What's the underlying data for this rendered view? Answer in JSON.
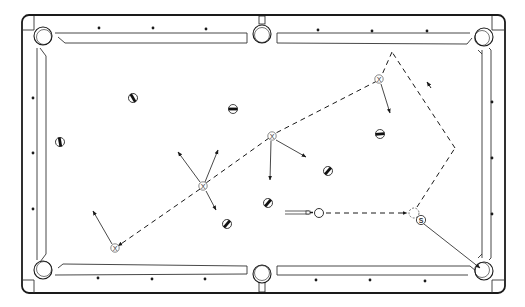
{
  "diagram": {
    "colors": {
      "line": "#1a1a1a",
      "rail": "#333333",
      "background": "#ffffff",
      "ball_stripe": "#111111"
    },
    "table": {
      "pockets": [
        "top-left",
        "top-center",
        "top-right",
        "bottom-left",
        "bottom-center",
        "bottom-right"
      ],
      "diamonds_per_long_rail_section": 2,
      "diamonds_per_short_rail": 3
    },
    "cue_ball": {
      "label": ""
    },
    "object_ball": {
      "label": "S"
    },
    "ghost_ball": {
      "label": ""
    },
    "deflection_markers": [
      {
        "label": "X"
      },
      {
        "label": "X"
      },
      {
        "label": "X"
      },
      {
        "label": "X"
      }
    ],
    "obstacle_balls_count": 8
  }
}
